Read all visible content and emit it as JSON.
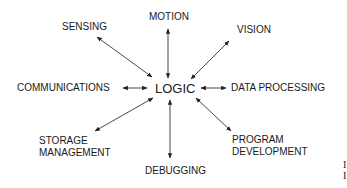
{
  "diagram": {
    "center": "LOGIC",
    "nodes": [
      {
        "id": "sensing",
        "label": "SENSING"
      },
      {
        "id": "motion",
        "label": "MOTION"
      },
      {
        "id": "vision",
        "label": "VISION"
      },
      {
        "id": "communications",
        "label": "COMMUNICATIONS"
      },
      {
        "id": "data-processing",
        "label": "DATA PROCESSING"
      },
      {
        "id": "storage-management",
        "label_line1": "STORAGE",
        "label_line2": "MANAGEMENT"
      },
      {
        "id": "debugging",
        "label": "DEBUGGING"
      },
      {
        "id": "program-development",
        "label_line1": "PROGRAM",
        "label_line2": "DEVELOPMENT"
      }
    ],
    "edges": "bidirectional arrows from LOGIC to every node",
    "colors": {
      "text": "#1a1a1a",
      "arrow": "#222222",
      "background": "#ffffff"
    }
  },
  "edge_artifact": {
    "line1": "I",
    "line2": "I"
  }
}
